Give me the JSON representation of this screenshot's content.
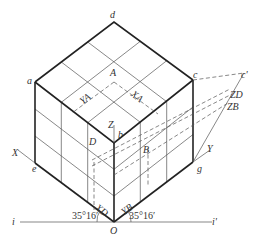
{
  "diagram": {
    "vertex_labels": {
      "a": "a",
      "b": "b",
      "c": "c",
      "d": "d",
      "e": "e",
      "g": "g",
      "c_prime": "c'",
      "O": "O"
    },
    "point_labels": {
      "A": "A",
      "B": "B",
      "D": "D"
    },
    "axis_labels": {
      "X": "X",
      "Y": "Y",
      "Z": "Z"
    },
    "coordinate_labels": {
      "XA": "XA",
      "YA": "YA",
      "XD": "XD",
      "YB": "YB",
      "ZD": "ZD",
      "ZB": "ZB"
    },
    "line_labels": {
      "i": "i",
      "i_prime": "i'"
    },
    "angles": {
      "left": "35°16′",
      "right": "35°16′"
    },
    "grid": "3x3 subdivisions on each visible face",
    "colors": {
      "line": "#222222",
      "thin_line": "#555555",
      "background": "#ffffff"
    }
  }
}
